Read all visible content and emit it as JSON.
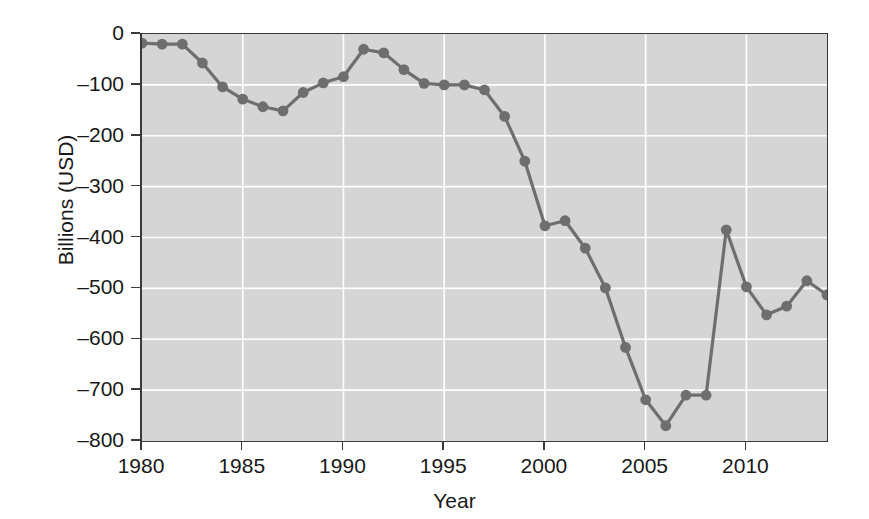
{
  "chart_data": {
    "type": "line",
    "title": "",
    "xlabel": "Year",
    "ylabel": "Billions (USD)",
    "xlim": [
      1980,
      2014
    ],
    "ylim": [
      -800,
      0
    ],
    "grid": true,
    "legend_position": "none",
    "x_ticks": [
      1980,
      1985,
      1990,
      1995,
      2000,
      2005,
      2010
    ],
    "y_ticks": [
      0,
      -100,
      -200,
      -300,
      -400,
      -500,
      -600,
      -700,
      -800
    ],
    "y_tick_labels": [
      "0",
      "–100",
      "–200",
      "–300",
      "–400",
      "–500",
      "–600",
      "–700",
      "–800"
    ],
    "x_tick_labels": [
      "1980",
      "1985",
      "1990",
      "1995",
      "2000",
      "2005",
      "2010"
    ],
    "marker": "circle",
    "series_color": "#6e6e6e",
    "plot_background": "#d5d5d5",
    "gridline_color": "#ffffff",
    "axis_color": "#3a3a3a",
    "x": [
      1980,
      1981,
      1982,
      1983,
      1984,
      1985,
      1986,
      1987,
      1988,
      1989,
      1990,
      1991,
      1992,
      1993,
      1994,
      1995,
      1996,
      1997,
      1998,
      1999,
      2000,
      2001,
      2002,
      2003,
      2004,
      2005,
      2006,
      2007,
      2008,
      2009,
      2010,
      2011,
      2012,
      2013,
      2014
    ],
    "values": [
      -18,
      -20,
      -20,
      -57,
      -104,
      -128,
      -143,
      -151,
      -115,
      -96,
      -84,
      -30,
      -37,
      -70,
      -97,
      -100,
      -100,
      -110,
      -162,
      -250,
      -377,
      -367,
      -421,
      -499,
      -616,
      -719,
      -770,
      -710,
      -710,
      -385,
      -497,
      -552,
      -535,
      -485,
      -513
    ]
  }
}
